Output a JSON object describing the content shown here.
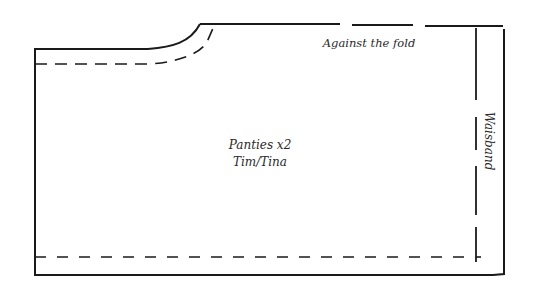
{
  "diagram": {
    "type": "sewing-pattern-piece",
    "labels": {
      "fold": "Against the fold",
      "waistband": "Waisband",
      "piece_name": "Panties x2",
      "piece_size": "Tim/Tina"
    },
    "colors": {
      "line": "#1a1a1a",
      "text": "#2a2a2a",
      "background": "#ffffff"
    }
  }
}
